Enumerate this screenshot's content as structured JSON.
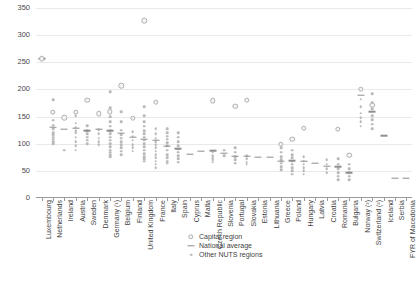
{
  "chart_data": {
    "type": "scatter",
    "title": "",
    "xlabel": "",
    "ylabel": "",
    "ylim": [
      0,
      350
    ],
    "yticks": [
      0,
      50,
      100,
      150,
      200,
      250,
      300,
      350
    ],
    "grid": true,
    "legend_position": "bottom-center",
    "legend": [
      {
        "key": "capital",
        "label": "Capital region",
        "marker": "open-circle"
      },
      {
        "key": "national",
        "label": "National average",
        "marker": "dash"
      },
      {
        "key": "other",
        "label": "Other NUTS regions",
        "marker": "small-dot"
      }
    ],
    "categories": [
      "Luxembourg",
      "Netherlands",
      "Ireland",
      "Austria",
      "Sweden",
      "Denmark",
      "Germany (¹)",
      "Belgium",
      "Finland",
      "United Kingdom",
      "France",
      "Italy",
      "Spain",
      "Cyprus",
      "Malta",
      "Czech Republic",
      "Slovenia",
      "Portugal",
      "Slovakia",
      "Estonia",
      "Lithuania",
      "Greece",
      "Poland",
      "Hungary",
      "Latvia",
      "Croatia",
      "Romania",
      "Bulgaria",
      "Norway (²)",
      "Switzerland (²)",
      "Iceland",
      "Serbia",
      "FYR of Macedonia"
    ],
    "series": [
      {
        "name": "Capital region",
        "values": [
          257,
          158,
          148,
          158,
          180,
          155,
          159,
          207,
          147,
          327,
          176,
          null,
          null,
          null,
          null,
          179,
          null,
          169,
          180,
          null,
          null,
          99,
          108,
          129,
          null,
          null,
          127,
          79,
          200,
          171,
          null,
          null,
          null
        ]
      },
      {
        "name": "National average",
        "values": [
          257,
          131,
          127,
          129,
          124,
          127,
          124,
          119,
          112,
          108,
          107,
          96,
          91,
          81,
          86,
          87,
          83,
          77,
          77,
          75,
          75,
          68,
          69,
          68,
          64,
          59,
          58,
          47,
          189,
          159,
          115,
          37,
          36
        ]
      },
      {
        "name": "Other NUTS regions",
        "values": [
          [],
          [
            181,
            143,
            134,
            128,
            120,
            116,
            112,
            108,
            104,
            100
          ],
          [
            88
          ],
          [
            152,
            138,
            130,
            124,
            120,
            112,
            104,
            96,
            88
          ],
          [
            133,
            124,
            118,
            112,
            106,
            100
          ],
          [
            126,
            118,
            110,
            104,
            98
          ],
          [
            196,
            166,
            150,
            140,
            132,
            124,
            118,
            112,
            106,
            100,
            94,
            88,
            84,
            80,
            76
          ],
          [
            159,
            140,
            125,
            116,
            110,
            104,
            98,
            92,
            86,
            80
          ],
          [
            122,
            114,
            106,
            98,
            92,
            86
          ],
          [
            168,
            152,
            140,
            132,
            124,
            118,
            112,
            106,
            100,
            94,
            88,
            82,
            76,
            72,
            68
          ],
          [
            128,
            118,
            110,
            104,
            98,
            92,
            86,
            80,
            74,
            68,
            62,
            56
          ],
          [
            128,
            120,
            114,
            108,
            102,
            96,
            88,
            80,
            74,
            68,
            64
          ],
          [
            120,
            112,
            104,
            96,
            90,
            84,
            78,
            72,
            66
          ],
          [],
          [],
          [
            84,
            78,
            74,
            70,
            66
          ],
          [
            88,
            78
          ],
          [
            92,
            84,
            76,
            70,
            64
          ],
          [
            78,
            72,
            66,
            62
          ],
          [],
          [],
          [
            92,
            84,
            76,
            70,
            64,
            58,
            52
          ],
          [
            88,
            80,
            74,
            68,
            62,
            56,
            50,
            44
          ],
          [
            76,
            68,
            62,
            56,
            50,
            44
          ],
          [],
          [
            70,
            62,
            54,
            46
          ],
          [
            72,
            62,
            54,
            46,
            40,
            34
          ],
          [
            62,
            54,
            46,
            40,
            34
          ],
          [
            182,
            168,
            156,
            148,
            140,
            132
          ],
          [
            192,
            176,
            164,
            152,
            144,
            136,
            128
          ],
          [],
          [],
          []
        ]
      }
    ]
  }
}
